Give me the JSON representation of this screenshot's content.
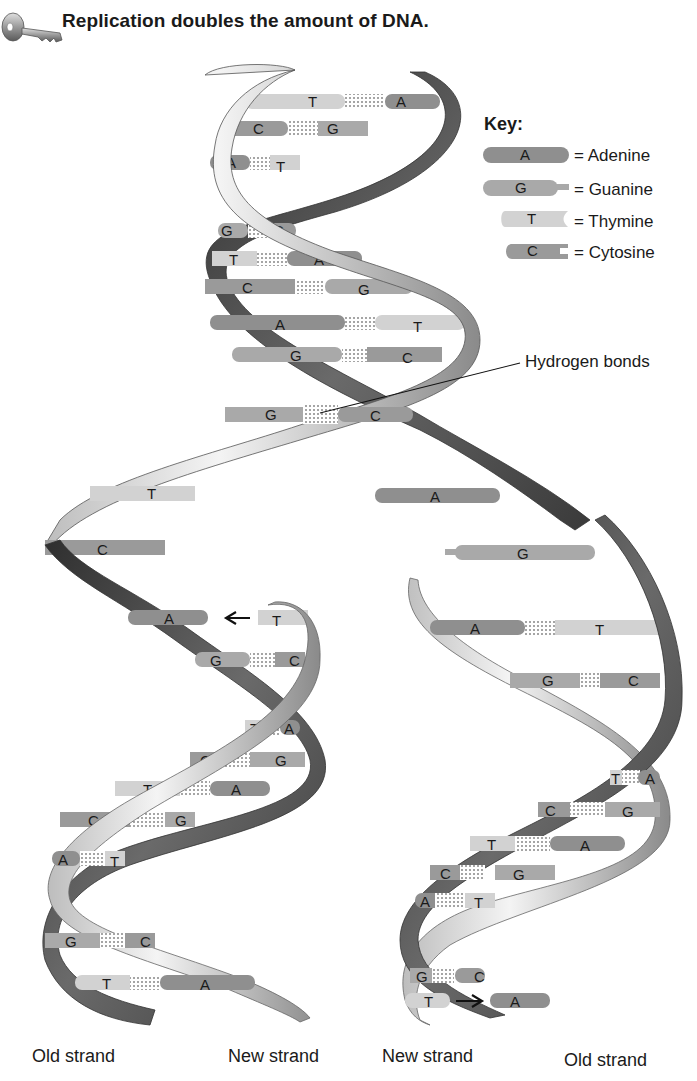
{
  "title": "Replication doubles the amount of DNA.",
  "icons": {
    "header": "key-icon"
  },
  "key": {
    "heading": "Key:",
    "items": [
      {
        "letter": "A",
        "label": "= Adenine",
        "shape": "rounded",
        "color": "#8f8f8f"
      },
      {
        "letter": "G",
        "label": "= Guanine",
        "shape": "tab",
        "color": "#a9a9a9"
      },
      {
        "letter": "T",
        "label": "= Thymine",
        "shape": "notch",
        "color": "#d2d2d2"
      },
      {
        "letter": "C",
        "label": "= Cytosine",
        "shape": "slot",
        "color": "#9a9a9a"
      }
    ]
  },
  "callout": {
    "label": "Hydrogen bonds"
  },
  "strand_labels": [
    "Old strand",
    "New strand",
    "New strand",
    "Old strand"
  ],
  "colors": {
    "adenine": "#8f8f8f",
    "guanine": "#a9a9a9",
    "thymine": "#d2d2d2",
    "cytosine": "#9a9a9a",
    "backbone_dark": "#3a3a3a",
    "backbone_light": "#e8e8e8",
    "bond_dots": "#333333"
  },
  "parent_helix": {
    "pairs": [
      {
        "left": "T",
        "right": "A"
      },
      {
        "left": "C",
        "right": "G"
      },
      {
        "left": "A",
        "right": "T"
      },
      {
        "left": "G",
        "right": "C"
      },
      {
        "left": "T",
        "right": "A"
      },
      {
        "left": "C",
        "right": "G"
      },
      {
        "left": "A",
        "right": "T"
      },
      {
        "left": "G",
        "right": "C"
      },
      {
        "left": "G",
        "right": "C"
      }
    ]
  },
  "unpaired": {
    "left": [
      "T",
      "C"
    ],
    "right": [
      "A",
      "G"
    ]
  },
  "left_daughter": {
    "incoming": {
      "template": "A",
      "new": "T"
    },
    "pairs": [
      {
        "left": "G",
        "right": "C"
      },
      {
        "left": "T",
        "right": "A"
      },
      {
        "left": "C",
        "right": "G"
      },
      {
        "left": "T",
        "right": "A"
      },
      {
        "left": "C",
        "right": "G"
      },
      {
        "left": "A",
        "right": "T"
      },
      {
        "left": "G",
        "right": "C"
      },
      {
        "left": "T",
        "right": "A"
      }
    ]
  },
  "right_daughter": {
    "pairs": [
      {
        "left": "A",
        "right": "T"
      },
      {
        "left": "G",
        "right": "C"
      },
      {
        "left": "T",
        "right": "A"
      },
      {
        "left": "C",
        "right": "G"
      },
      {
        "left": "T",
        "right": "A"
      },
      {
        "left": "C",
        "right": "G"
      },
      {
        "left": "A",
        "right": "T"
      },
      {
        "left": "G",
        "right": "C"
      }
    ],
    "incoming": {
      "new": "T",
      "template": "A"
    }
  }
}
